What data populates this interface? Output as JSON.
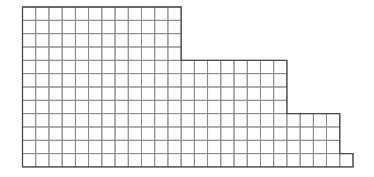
{
  "diagram": {
    "type": "stepped-grid",
    "origin": {
      "x": 22.5,
      "y": 7
    },
    "cell_width": 13.22,
    "cell_height": 13.33,
    "rows_total": 12,
    "row_bands": [
      {
        "rows": 4,
        "columns": 12
      },
      {
        "rows": 4,
        "columns": 20
      },
      {
        "rows": 3,
        "columns": 24
      },
      {
        "rows": 1,
        "columns": 25
      }
    ],
    "colors": {
      "background": "#ffffff",
      "inner_line": "#8a8a8a",
      "outer_line": "#4a4a4a"
    }
  }
}
